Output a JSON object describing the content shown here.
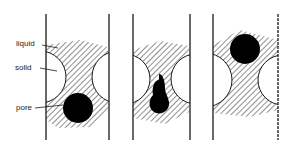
{
  "labels": {
    "liquid": "liquid",
    "solid": "solid",
    "pore": "pore"
  },
  "panels": [
    {
      "id": "panel-1",
      "description": "pore located at lower neck between solid particles"
    },
    {
      "id": "panel-2",
      "description": "pore elongated within the neck between solid particles"
    },
    {
      "id": "panel-3",
      "description": "pore located at upper part of liquid region"
    }
  ],
  "colors": {
    "line": "#1a1a1a",
    "hatch": "#333333",
    "pore": "#000000",
    "solid": "#ffffff"
  }
}
